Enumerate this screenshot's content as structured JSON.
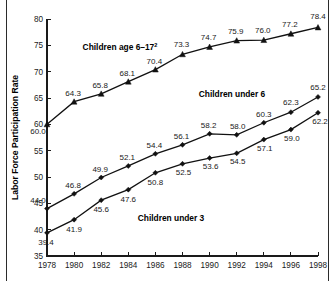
{
  "chart_data": {
    "type": "line",
    "title": "",
    "xlabel": "",
    "ylabel": "Labor Force Participation Rate",
    "x": [
      1978,
      1980,
      1982,
      1984,
      1986,
      1988,
      1990,
      1992,
      1994,
      1996,
      1998
    ],
    "xtick_labels": [
      "1978",
      "1980",
      "1982",
      "1984",
      "1986",
      "1988",
      "1990",
      "1992",
      "1994",
      "1996",
      "1998"
    ],
    "ytick_labels": [
      "35",
      "40",
      "45",
      "50",
      "55",
      "60",
      "65",
      "70",
      "75",
      "80"
    ],
    "yticks": [
      35,
      40,
      45,
      50,
      55,
      60,
      65,
      70,
      75,
      80
    ],
    "ylim": [
      35,
      80
    ],
    "xlim": [
      1978,
      1998
    ],
    "grid": false,
    "legend_position": "inline-annotations",
    "series": [
      {
        "name": "Children age 6–17",
        "label": "Children age 6–17",
        "footnote_marker": "2",
        "marker": "triangle",
        "values": [
          60.0,
          64.3,
          65.8,
          68.1,
          70.4,
          73.3,
          74.7,
          75.9,
          76.0,
          77.2,
          78.4
        ],
        "value_labels": [
          "60.0",
          "64.3",
          "65.8",
          "68.1",
          "70.4",
          "73.3",
          "74.7",
          "75.9",
          "76.0",
          "77.2",
          "78.4"
        ]
      },
      {
        "name": "Children under 6",
        "label": "Children under 6",
        "footnote_marker": "",
        "marker": "diamond",
        "values": [
          44.0,
          46.8,
          49.9,
          52.1,
          54.4,
          56.1,
          58.2,
          58.0,
          60.3,
          62.3,
          65.2
        ],
        "value_labels": [
          "44.0",
          "46.8",
          "49.9",
          "52.1",
          "54.4",
          "56.1",
          "58.2",
          "58.0",
          "60.3",
          "62.3",
          "65.2"
        ]
      },
      {
        "name": "Children under 3",
        "label": "Children under 3",
        "footnote_marker": "",
        "marker": "diamond",
        "values": [
          39.4,
          41.9,
          45.6,
          47.6,
          50.8,
          52.5,
          53.6,
          54.5,
          57.1,
          59.0,
          62.2
        ],
        "value_labels": [
          "39.4",
          "41.9",
          "45.6",
          "47.6",
          "50.8",
          "52.5",
          "53.6",
          "54.5",
          "57.1",
          "59.0",
          "62.2"
        ]
      }
    ],
    "colors": {
      "line": "#111111",
      "axis": "#1a1a1a",
      "text": "#1a1a1a",
      "background": "#ffffff"
    }
  }
}
